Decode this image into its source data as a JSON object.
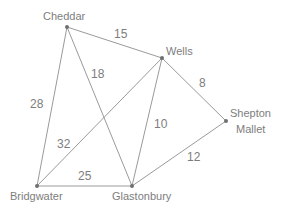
{
  "diagram": {
    "type": "weighted-undirected-graph",
    "nodes": [
      {
        "id": "cheddar",
        "label": "Cheddar",
        "x": 67,
        "y": 27
      },
      {
        "id": "wells",
        "label": "Wells",
        "x": 162,
        "y": 58
      },
      {
        "id": "shepton",
        "label_line1": "Shepton",
        "label_line2": "Mallet",
        "x": 226,
        "y": 121
      },
      {
        "id": "bridgwater",
        "label": "Bridgwater",
        "x": 37,
        "y": 186
      },
      {
        "id": "glastonbury",
        "label": "Glastonbury",
        "x": 132,
        "y": 186
      }
    ],
    "edges": [
      {
        "from": "Cheddar",
        "to": "Wells",
        "weight": "15"
      },
      {
        "from": "Cheddar",
        "to": "Bridgwater",
        "weight": "28"
      },
      {
        "from": "Cheddar",
        "to": "Glastonbury",
        "weight": "18"
      },
      {
        "from": "Wells",
        "to": "Shepton Mallet",
        "weight": "8"
      },
      {
        "from": "Wells",
        "to": "Bridgwater",
        "weight": "32"
      },
      {
        "from": "Wells",
        "to": "Glastonbury",
        "weight": "10"
      },
      {
        "from": "Shepton Mallet",
        "to": "Glastonbury",
        "weight": "12"
      },
      {
        "from": "Bridgwater",
        "to": "Glastonbury",
        "weight": "25"
      }
    ]
  }
}
